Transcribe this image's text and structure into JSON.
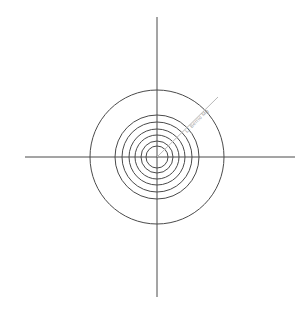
{
  "figure": {
    "name": "concentric-circles-polar-diagram",
    "background_color": "#ffffff",
    "width": 307,
    "height": 311,
    "center_x": 157,
    "center_y": 157
  },
  "axes": {
    "color": "#4a4a4a",
    "stroke_width": 1,
    "horizontal": {
      "label": "horizontal-axis",
      "x1": 25,
      "y1": 157,
      "x2": 295,
      "y2": 157
    },
    "vertical": {
      "label": "vertical-axis",
      "x1": 157,
      "y1": 17,
      "x2": 157,
      "y2": 297
    }
  },
  "ray": {
    "label": "diagonal-ray",
    "color": "#b8b8b8",
    "stroke_width": 1,
    "x1": 157,
    "y1": 157,
    "x2": 218,
    "y2": 97,
    "angle_degrees": 45
  },
  "watermark": {
    "label": "watermark-label",
    "text": "Lt Berrio Mg",
    "color": "#9a9a9a",
    "font_size": 5,
    "rotation_degrees": -45,
    "x": 198,
    "y": 122
  },
  "chart_data": {
    "type": "scatter",
    "title": "",
    "subtitle": "",
    "xlabel": "",
    "ylabel": "",
    "grid": false,
    "legend_position": "none",
    "center": [
      157,
      157
    ],
    "xlim": [
      25,
      295
    ],
    "ylim": [
      17,
      297
    ],
    "series": [
      {
        "name": "concentric-rings",
        "shape": "circle",
        "stroke_color": "#4a4a4a",
        "stroke_width": 1,
        "fill": "none",
        "radii": [
          67,
          42,
          35,
          28,
          22,
          16,
          11
        ],
        "count": 7
      }
    ],
    "annotations": [
      {
        "name": "diagonal-ray",
        "type": "line",
        "from": [
          157,
          157
        ],
        "to": [
          218,
          97
        ],
        "color": "#b8b8b8"
      },
      {
        "name": "watermark-label",
        "type": "text",
        "text": "Lt Berrio Mg",
        "at": [
          198,
          122
        ],
        "rotation": -45,
        "color": "#9a9a9a"
      }
    ]
  }
}
